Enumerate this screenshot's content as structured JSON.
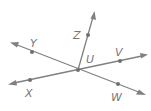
{
  "diagram": {
    "type": "geometry-rays",
    "colors": {
      "line": "#808080",
      "point": "#707070",
      "label": "#777777",
      "background": "#ffffff"
    },
    "center": {
      "label": "U",
      "x": 78,
      "y": 70,
      "label_x": 88,
      "label_y": 64
    },
    "lines": [
      {
        "name": "line-YW",
        "from": {
          "x": 12,
          "y": 43
        },
        "to": {
          "x": 144,
          "y": 94
        },
        "arrows": "both"
      },
      {
        "name": "line-XV",
        "from": {
          "x": 10,
          "y": 84
        },
        "to": {
          "x": 146,
          "y": 55
        },
        "arrows": "both"
      }
    ],
    "rays": [
      {
        "name": "ray-UZ",
        "from": {
          "x": 78,
          "y": 70
        },
        "to": {
          "x": 94,
          "y": 13
        },
        "arrows": "end"
      }
    ],
    "points": [
      {
        "label": "Z",
        "x": 88,
        "y": 35,
        "label_x": 74,
        "label_y": 39
      },
      {
        "label": "Y",
        "x": 32,
        "y": 52,
        "label_x": 30,
        "label_y": 46
      },
      {
        "label": "X",
        "x": 30,
        "y": 80,
        "label_x": 25,
        "label_y": 96
      },
      {
        "label": "V",
        "x": 120,
        "y": 61,
        "label_x": 115,
        "label_y": 56
      },
      {
        "label": "W",
        "x": 118,
        "y": 84,
        "label_x": 111,
        "label_y": 100
      }
    ],
    "labels": {
      "U": "U",
      "Z": "Z",
      "Y": "Y",
      "X": "X",
      "V": "V",
      "W": "W"
    }
  }
}
